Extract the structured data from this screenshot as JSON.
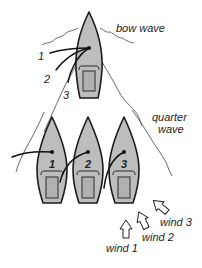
{
  "diagram": {
    "labels": {
      "bow_wave": "bow wave",
      "quarter_wave_line1": "quarter",
      "quarter_wave_line2": "wave"
    },
    "top_boat": {
      "sheet_labels": [
        "1",
        "2",
        "3"
      ]
    },
    "boats": [
      {
        "label": "1"
      },
      {
        "label": "2"
      },
      {
        "label": "3"
      }
    ],
    "winds": [
      {
        "label": "wind 1"
      },
      {
        "label": "wind 2"
      },
      {
        "label": "wind 3"
      }
    ],
    "colors": {
      "hull_fill": "#bdbdbd",
      "outline": "#1a1a1a",
      "background": "#ffffff"
    }
  }
}
